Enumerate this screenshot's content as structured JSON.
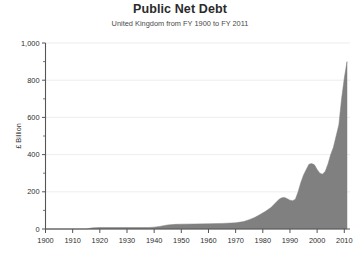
{
  "chart_data": {
    "type": "area",
    "title": "Public Net Debt",
    "subtitle": "United Kingdom from FY 1900 to FY 2011",
    "xlabel": "",
    "ylabel": "£ Billion",
    "xlim": [
      1900,
      2011
    ],
    "ylim": [
      0,
      1000
    ],
    "grid": true,
    "legend": "none",
    "series_color": "#808080",
    "axis_color": "#555555",
    "grid_color": "#e8e8e8",
    "y_ticks": [
      0,
      200,
      400,
      600,
      800,
      1000
    ],
    "y_tick_labels": [
      "0",
      "200",
      "400",
      "600",
      "800",
      "1,000"
    ],
    "y_minor_ticks": [
      100,
      300,
      500,
      700,
      900
    ],
    "x_ticks": [
      1900,
      1910,
      1920,
      1930,
      1940,
      1950,
      1960,
      1970,
      1980,
      1990,
      2000,
      2010
    ],
    "x_tick_labels": [
      "1900",
      "1910",
      "1920",
      "1930",
      "1940",
      "1950",
      "1960",
      "1970",
      "1980",
      "1990",
      "2000",
      "2010"
    ],
    "x": [
      1900,
      1905,
      1910,
      1915,
      1917,
      1918,
      1920,
      1925,
      1930,
      1935,
      1938,
      1940,
      1942,
      1945,
      1948,
      1950,
      1955,
      1960,
      1965,
      1970,
      1973,
      1975,
      1977,
      1979,
      1981,
      1983,
      1985,
      1986,
      1987,
      1988,
      1989,
      1990,
      1991,
      1992,
      1993,
      1994,
      1995,
      1996,
      1997,
      1998,
      1999,
      2000,
      2001,
      2002,
      2003,
      2004,
      2005,
      2006,
      2007,
      2008,
      2009,
      2010,
      2011
    ],
    "values": [
      0,
      0,
      0,
      0,
      6,
      7,
      8,
      8,
      8,
      8,
      8,
      10,
      14,
      22,
      25,
      26,
      27,
      28,
      30,
      33,
      40,
      50,
      62,
      78,
      95,
      115,
      145,
      160,
      168,
      170,
      163,
      155,
      152,
      160,
      200,
      250,
      290,
      320,
      348,
      352,
      345,
      320,
      300,
      295,
      310,
      350,
      400,
      440,
      500,
      560,
      700,
      810,
      900
    ]
  }
}
